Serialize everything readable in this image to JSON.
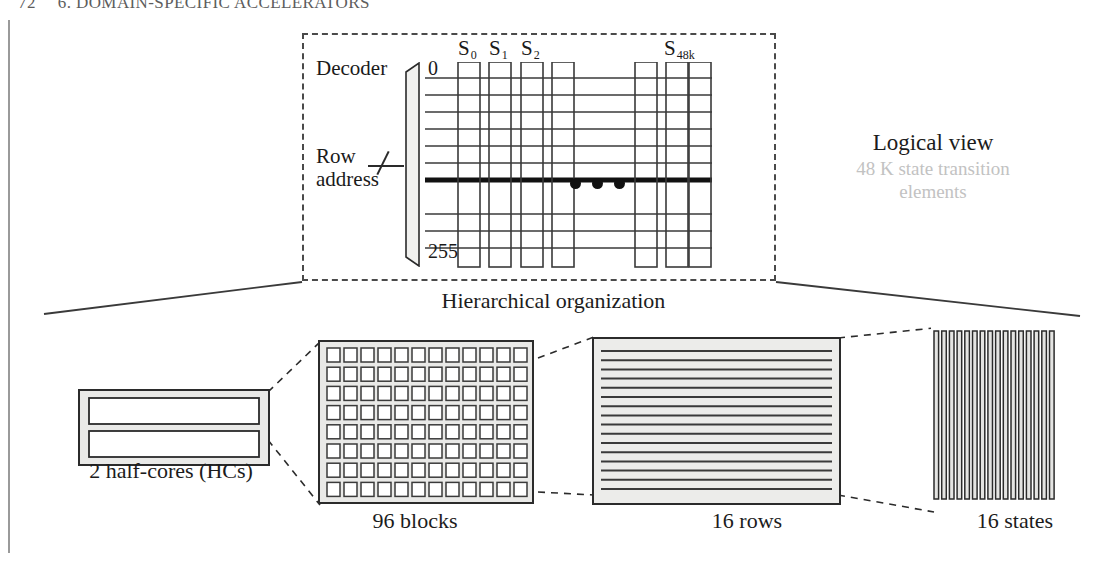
{
  "page": {
    "folio": "72",
    "running_head": "6. DOMAIN-SPECIFIC ACCELERATORS"
  },
  "logical_view": {
    "decoder_label": "Decoder",
    "row_address_label_line1": "Row",
    "row_address_label_line2": "address",
    "address_first": "0",
    "address_last": "255",
    "column_labels": [
      "S",
      "S",
      "S",
      "S"
    ],
    "column_subscripts": [
      "0",
      "1",
      "2",
      "48k"
    ],
    "ellipsis": "•••",
    "caption_title": "Logical view",
    "caption_sub": "48 K state transition elements",
    "rows_total": 12,
    "selected_row_index": 6,
    "left_columns": 4,
    "right_columns": 3
  },
  "hierarchy": {
    "caption": "Hierarchical organization",
    "panels": [
      {
        "name": "half-cores",
        "caption": "2 half-cores (HCs)",
        "count": 2,
        "kind": "bars-horizontal"
      },
      {
        "name": "blocks",
        "caption": "96 blocks",
        "count": 96,
        "cols": 12,
        "rows": 8,
        "kind": "grid"
      },
      {
        "name": "rows",
        "caption": "16 rows",
        "count": 16,
        "kind": "stripes-horizontal"
      },
      {
        "name": "states",
        "caption": "16 states",
        "count": 16,
        "kind": "stripes-vertical"
      }
    ]
  },
  "colors": {
    "ink": "#1a1a1a",
    "rule": "#4a4a4a",
    "muted": "#c2c2c2",
    "panel_fill": "#e8e8e6",
    "page": "#ffffff"
  }
}
